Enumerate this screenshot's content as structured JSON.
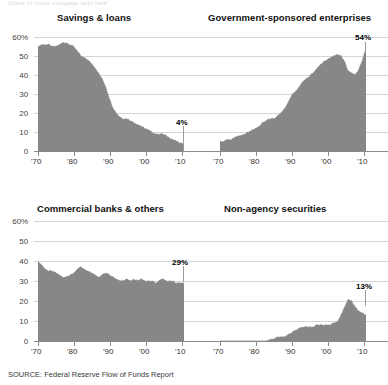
{
  "header": {
    "kicker": "Share of home mortgage debt held"
  },
  "source_note": "SOURCE: Federal Reserve Flow of Funds Report",
  "axis": {
    "y_ticks": [
      "60%",
      "50",
      "40",
      "30",
      "20",
      "10",
      "0"
    ],
    "x_ticks": [
      "'70",
      "'80",
      "'90",
      "'00",
      "'10"
    ]
  },
  "panels": {
    "savings_loans": {
      "title": "Savings & loans",
      "end_label": "4%"
    },
    "gse": {
      "title": "Government-sponsored enterprises",
      "end_label": "54%"
    },
    "commercial_banks": {
      "title": "Commercial banks & others",
      "end_label": "29%"
    },
    "non_agency": {
      "title": "Non-agency securities",
      "end_label": "13%"
    }
  },
  "colors": {
    "area_fill": "#878787",
    "gridline": "#d6d6d6",
    "baseline": "#8a8a8a",
    "text": "#1b1b1b"
  },
  "chart_data": [
    {
      "type": "area",
      "id": "savings_loans",
      "title": "Savings & loans",
      "xlabel": "",
      "ylabel": "Share of home mortgage debt (%)",
      "xlim": [
        1970,
        2011
      ],
      "ylim": [
        0,
        60
      ],
      "grid": true,
      "legend": "none",
      "annotations": [
        {
          "text": "4%",
          "x": 2011,
          "y": 4
        }
      ],
      "x": [
        1970,
        1971,
        1972,
        1973,
        1974,
        1975,
        1976,
        1977,
        1978,
        1979,
        1980,
        1981,
        1982,
        1983,
        1984,
        1985,
        1986,
        1987,
        1988,
        1989,
        1990,
        1991,
        1992,
        1993,
        1994,
        1995,
        1996,
        1997,
        1998,
        1999,
        2000,
        2001,
        2002,
        2003,
        2004,
        2005,
        2006,
        2007,
        2008,
        2009,
        2010,
        2011
      ],
      "values": [
        55,
        56,
        56,
        56,
        55,
        55,
        56,
        57,
        57,
        56,
        55,
        53,
        50,
        49,
        48,
        46,
        44,
        41,
        38,
        34,
        28,
        23,
        20,
        18,
        17,
        17,
        16,
        15,
        14,
        13,
        12,
        11,
        10,
        9,
        9,
        9,
        8,
        7,
        6,
        5,
        4,
        4
      ]
    },
    {
      "type": "area",
      "id": "gse",
      "title": "Government-sponsored enterprises",
      "xlabel": "",
      "ylabel": "Share of home mortgage debt (%)",
      "xlim": [
        1970,
        2011
      ],
      "ylim": [
        0,
        60
      ],
      "grid": true,
      "legend": "none",
      "annotations": [
        {
          "text": "54%",
          "x": 2011,
          "y": 54
        }
      ],
      "x": [
        1970,
        1971,
        1972,
        1973,
        1974,
        1975,
        1976,
        1977,
        1978,
        1979,
        1980,
        1981,
        1982,
        1983,
        1984,
        1985,
        1986,
        1987,
        1988,
        1989,
        1990,
        1991,
        1992,
        1993,
        1994,
        1995,
        1996,
        1997,
        1998,
        1999,
        2000,
        2001,
        2002,
        2003,
        2004,
        2005,
        2006,
        2007,
        2008,
        2009,
        2010,
        2011
      ],
      "values": [
        5,
        5,
        6,
        6,
        7,
        8,
        8,
        9,
        10,
        11,
        12,
        13,
        15,
        16,
        17,
        17,
        18,
        20,
        22,
        25,
        29,
        31,
        33,
        36,
        38,
        39,
        41,
        43,
        45,
        47,
        48,
        49,
        50,
        51,
        50,
        47,
        42,
        41,
        40,
        43,
        48,
        54
      ]
    },
    {
      "type": "area",
      "id": "commercial_banks",
      "title": "Commercial banks & others",
      "xlabel": "",
      "ylabel": "Share of home mortgage debt (%)",
      "xlim": [
        1970,
        2011
      ],
      "ylim": [
        0,
        60
      ],
      "grid": true,
      "legend": "none",
      "annotations": [
        {
          "text": "29%",
          "x": 2011,
          "y": 29
        }
      ],
      "x": [
        1970,
        1971,
        1972,
        1973,
        1974,
        1975,
        1976,
        1977,
        1978,
        1979,
        1980,
        1981,
        1982,
        1983,
        1984,
        1985,
        1986,
        1987,
        1988,
        1989,
        1990,
        1991,
        1992,
        1993,
        1994,
        1995,
        1996,
        1997,
        1998,
        1999,
        2000,
        2001,
        2002,
        2003,
        2004,
        2005,
        2006,
        2007,
        2008,
        2009,
        2010,
        2011
      ],
      "values": [
        40,
        38,
        36,
        35,
        35,
        34,
        33,
        32,
        32,
        33,
        34,
        36,
        37,
        36,
        35,
        34,
        33,
        32,
        33,
        34,
        33,
        32,
        31,
        30,
        30,
        31,
        30,
        31,
        30,
        31,
        30,
        30,
        30,
        29,
        30,
        31,
        30,
        30,
        30,
        29,
        29,
        29
      ]
    },
    {
      "type": "area",
      "id": "non_agency",
      "title": "Non-agency securities",
      "xlabel": "",
      "ylabel": "Share of home mortgage debt (%)",
      "xlim": [
        1970,
        2011
      ],
      "ylim": [
        0,
        60
      ],
      "grid": true,
      "legend": "none",
      "annotations": [
        {
          "text": "13%",
          "x": 2011,
          "y": 13
        }
      ],
      "x": [
        1970,
        1971,
        1972,
        1973,
        1974,
        1975,
        1976,
        1977,
        1978,
        1979,
        1980,
        1981,
        1982,
        1983,
        1984,
        1985,
        1986,
        1987,
        1988,
        1989,
        1990,
        1991,
        1992,
        1993,
        1994,
        1995,
        1996,
        1997,
        1998,
        1999,
        2000,
        2001,
        2002,
        2003,
        2004,
        2005,
        2006,
        2007,
        2008,
        2009,
        2010,
        2011
      ],
      "values": [
        0,
        0,
        0,
        0,
        0,
        0,
        0,
        0,
        0,
        0,
        0,
        0,
        0,
        0,
        1,
        1,
        2,
        2,
        2,
        3,
        4,
        5,
        6,
        7,
        7,
        7,
        7,
        8,
        8,
        8,
        8,
        8,
        9,
        10,
        13,
        17,
        21,
        20,
        17,
        15,
        14,
        13
      ]
    }
  ]
}
